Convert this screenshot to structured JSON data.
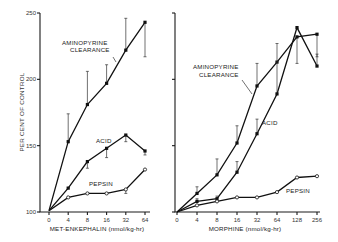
{
  "chart_data": [
    {
      "type": "line",
      "panel": "left",
      "title": "",
      "xlabel": "MET-ENKEPHALIN (nmol/kg-hr)",
      "ylabel": "PER CENT OF CONTROL",
      "ylim": [
        100,
        250
      ],
      "yticks": [
        100,
        150,
        200,
        250
      ],
      "categories": [
        "0",
        "4",
        "8",
        "16",
        "32",
        "64"
      ],
      "grid": false,
      "series": [
        {
          "name": "AMINOPYRINE CLEARANCE",
          "marker": "filled",
          "values": [
            101,
            153,
            181,
            197,
            222,
            243
          ],
          "error_upper": [
            null,
            174,
            206,
            211,
            246,
            null
          ],
          "error_lower": [
            null,
            null,
            null,
            null,
            null,
            217
          ]
        },
        {
          "name": "ACID",
          "marker": "filled",
          "values": [
            101,
            118,
            138,
            148,
            158,
            146
          ],
          "error_upper": [
            null,
            null,
            null,
            null,
            null,
            null
          ],
          "error_lower": [
            null,
            null,
            133,
            141,
            153,
            143
          ]
        },
        {
          "name": "PEPSIN",
          "marker": "open",
          "values": [
            101,
            111,
            114,
            114,
            117,
            132
          ],
          "error_upper": [
            null,
            null,
            null,
            null,
            null,
            null
          ],
          "error_lower": [
            null,
            null,
            null,
            null,
            114,
            null
          ]
        }
      ]
    },
    {
      "type": "line",
      "panel": "right",
      "title": "",
      "xlabel": "MORPHINE (nmol/kg-hr)",
      "ylabel": "PER CENT OF CONTROL",
      "ylim": [
        100,
        250
      ],
      "yticks": [
        100,
        150,
        200,
        250
      ],
      "categories": [
        "0",
        "4",
        "8",
        "16",
        "32",
        "64",
        "128",
        "256"
      ],
      "grid": false,
      "series": [
        {
          "name": "AMINOPYRINE CLEARANCE",
          "marker": "filled",
          "values": [
            100,
            114,
            128,
            152,
            195,
            213,
            232,
            234
          ],
          "error_upper": [
            null,
            119,
            140,
            165,
            212,
            null,
            null,
            null
          ],
          "error_lower": [
            null,
            null,
            null,
            null,
            null,
            null,
            212,
            217
          ]
        },
        {
          "name": "ACID",
          "marker": "filled",
          "values": [
            100,
            108,
            110,
            130,
            159,
            189,
            239,
            210
          ],
          "error_upper": [
            null,
            110,
            112,
            138,
            170,
            227,
            null,
            219
          ],
          "error_lower": [
            null,
            null,
            null,
            null,
            null,
            null,
            null,
            null
          ]
        },
        {
          "name": "PEPSIN",
          "marker": "open",
          "values": [
            100,
            105,
            108,
            111,
            111,
            115,
            126,
            127
          ],
          "error_upper": [
            null,
            null,
            null,
            null,
            null,
            null,
            null,
            null
          ],
          "error_lower": [
            null,
            null,
            null,
            null,
            null,
            null,
            null,
            null
          ]
        }
      ]
    }
  ],
  "labels": {
    "ylabel": "PER CENT OF CONTROL",
    "left_xlabel": "MET-ENKEPHALIN (nmol/kg-hr)",
    "right_xlabel": "MORPHINE (nmol/kg-hr)",
    "amino_line1": "AMINOPYRINE",
    "amino_line2": "CLEARANCE",
    "acid": "ACID",
    "pepsin": "PEPSIN",
    "yticks": [
      "250",
      "200",
      "150",
      "100"
    ],
    "left_xticks": [
      "0",
      "4",
      "8",
      "16",
      "32",
      "64"
    ],
    "right_xticks": [
      "0",
      "4",
      "8",
      "16",
      "32",
      "64",
      "128",
      "256"
    ]
  }
}
